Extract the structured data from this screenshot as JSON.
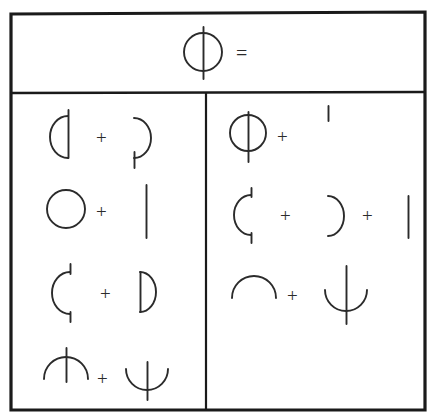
{
  "figure": {
    "title_row": {
      "subject_glyph": "circle-with-vertical-line",
      "equals_sign": "="
    },
    "plus_sign": "+",
    "columns": [
      {
        "name": "left-column",
        "rows": [
          {
            "row_index": 1,
            "terms": [
              "left-half-circle-with-stem",
              "right-arc-with-bottom-stem"
            ],
            "operators": [
              "+"
            ]
          },
          {
            "row_index": 2,
            "terms": [
              "full-circle",
              "vertical-bar"
            ],
            "operators": [
              "+"
            ]
          },
          {
            "row_index": 3,
            "terms": [
              "left-arc-with-two-stems",
              "right-half-circle-with-stem"
            ],
            "operators": [
              "+"
            ]
          },
          {
            "row_index": 4,
            "terms": [
              "up-arc-with-vertical-line",
              "down-cup-with-vertical-line"
            ],
            "operators": [
              "+"
            ]
          }
        ]
      },
      {
        "name": "right-column",
        "rows": [
          {
            "row_index": 1,
            "terms": [
              "circle-with-vertical-line",
              "short-tick-raised"
            ],
            "operators": [
              "+"
            ]
          },
          {
            "row_index": 2,
            "terms": [
              "left-arc-with-two-stems",
              "right-arc",
              "vertical-bar"
            ],
            "operators": [
              "+",
              "+"
            ]
          },
          {
            "row_index": 3,
            "terms": [
              "up-arc",
              "down-cup-with-vertical-line"
            ],
            "operators": [
              "+"
            ]
          }
        ]
      }
    ],
    "colors": {
      "background": "#ffffff",
      "ink": "#1a1a1a",
      "glyph_ink": "#2b2b2b"
    },
    "geometry": {
      "outer_border_left": 11,
      "outer_border_top": 13,
      "outer_border_right": 425,
      "outer_border_bottom": 410,
      "header_divider_y": 93,
      "column_divider_x": 206
    }
  }
}
